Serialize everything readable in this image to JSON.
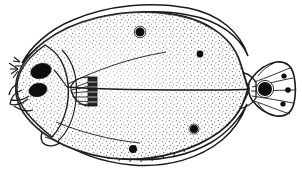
{
  "figure": {
    "subject_common_name": "flounder",
    "view": "left side, ocular surface",
    "style": "line drawing with stipple shading",
    "background_color": "#ffffff",
    "ink_color": "#1a1a1a",
    "stipple_color": "#5a5a5a",
    "canvas": {
      "width": 302,
      "height": 173
    }
  },
  "anatomy": {
    "body": {
      "name": "body-outline",
      "shape": "ovate-compressed flatfish disc",
      "outline_path": "M 16,92 C 14,74 26,56 44,42 C 74,19 120,9 163,13 C 205,17 232,37 240,62 C 244,74 246,82 248,88 C 246,97 242,108 234,118 C 218,138 186,153 150,158 C 110,163 68,152 42,132 C 24,118 17,105 16,92 Z",
      "fill": "#ffffff"
    },
    "head": {
      "name": "head-region",
      "outline_path": "M 17,90 C 16,74 27,58 45,45 C 58,52 66,66 68,84 C 70,104 64,124 52,137 C 32,121 18,106 17,90 Z",
      "gill_cover_path": "M 62,50 C 74,62 78,80 76,100 C 74,118 68,132 58,141"
    },
    "eyes": [
      {
        "name": "upper-eye",
        "cx": 41,
        "cy": 71,
        "rx": 10.5,
        "ry": 7.4,
        "rotation": -16,
        "color": "#0d0d0d"
      },
      {
        "name": "lower-eye",
        "cx": 38,
        "cy": 90,
        "rx": 9.2,
        "ry": 6.6,
        "rotation": -14,
        "color": "#0d0d0d"
      }
    ],
    "mouth": {
      "name": "mouth",
      "paths": [
        "M 22,90 C 16,92 11,97 10,104 C 14,106 22,104 28,99",
        "M 11,100 C 16,101 23,100 29,96",
        "M 14,106 C 20,110 27,112 33,110",
        "M 18,84 C 13,86 10,90 9,95"
      ]
    },
    "snout_spines": {
      "name": "snout-spines",
      "paths": [
        "M 18,69 L 9,63 M 18,69 L 10,69 M 18,69 L 11,74 M 18,71 L 13,78",
        "M 20,62 L 14,57 M 20,62 L 13,61 M 22,66 L 15,66"
      ]
    },
    "pectoral_fin": {
      "name": "pectoral-fin",
      "base_path": "M 71,86 C 74,80 80,77 88,77 L 95,79 L 96,104 L 88,106 C 79,105 73,98 71,90 Z",
      "rays": [
        "M 73,88 L 94,80",
        "M 72,90 L 94,85",
        "M 72,93 L 94,91",
        "M 73,97 L 94,97",
        "M 75,101 L 94,102",
        "M 78,104 L 93,105"
      ],
      "dark_tip": {
        "x": 88,
        "y": 77,
        "width": 9,
        "height": 29,
        "color": "#242424"
      }
    },
    "pelvic_fin": {
      "name": "pelvic-fin",
      "path": "M 48,126 C 42,130 39,137 43,143 C 48,148 58,146 63,140 C 67,135 66,129 62,126 Z",
      "rays": [
        "M 46,131 C 52,134 58,137 62,139",
        "M 45,137 C 51,139 57,141 62,142"
      ]
    },
    "dorsal_fin": {
      "name": "dorsal-fin",
      "membrane_path": "M 22,63 C 30,48 48,30 73,20 C 108,5 152,1 188,8 C 219,14 240,32 248,56 C 240,36 218,20 188,15 C 152,8 110,13 76,27 C 50,38 32,50 22,63 Z",
      "ray_count": 22,
      "ray_lines": [
        "M 24,62 L 21,68",
        "M 30,54 L 26,61",
        "M 37,47 L 33,55",
        "M 45,41 L 41,49",
        "M 54,35 L 50,44",
        "M 63,30 L 60,39",
        "M 73,25 L 70,35",
        "M 83,21 L 81,31",
        "M 94,18 L 92,28",
        "M 105,15 L 104,26",
        "M 116,13 L 115,24",
        "M 127,12 L 127,23",
        "M 138,12 L 139,23",
        "M 149,13 L 150,24",
        "M 160,15 L 162,26",
        "M 171,18 L 173,29",
        "M 181,22 L 184,33",
        "M 191,27 L 194,38",
        "M 201,33 L 205,44",
        "M 211,39 L 215,51",
        "M 220,46 L 225,58",
        "M 229,54 L 234,66"
      ]
    },
    "anal_fin": {
      "name": "anal-fin",
      "membrane_path": "M 62,140 C 74,152 100,162 132,165 C 168,168 200,158 222,140 C 234,130 242,118 247,104 C 240,118 228,132 212,142 C 190,155 160,162 130,159 C 100,156 76,148 62,140 Z",
      "ray_count": 18,
      "ray_lines": [
        "M 68,143 L 66,136",
        "M 77,149 L 76,141",
        "M 87,153 L 87,145",
        "M 97,156 L 98,148",
        "M 108,159 L 109,151",
        "M 119,161 L 120,153",
        "M 130,162 L 131,154",
        "M 141,162 L 142,154",
        "M 152,161 L 153,153",
        "M 163,159 L 164,151",
        "M 174,156 L 175,148",
        "M 184,152 L 186,144",
        "M 194,147 L 196,139",
        "M 204,141 L 207,133",
        "M 213,134 L 216,126",
        "M 221,126 L 225,118",
        "M 229,118 L 234,110",
        "M 236,109 L 241,101"
      ]
    },
    "caudal_peduncle": {
      "name": "caudal-peduncle",
      "path": "M 238,72 C 244,78 248,84 249,89 C 248,95 244,102 238,109 C 245,108 252,104 256,98 L 256,82 C 252,76 245,72 238,72 Z"
    },
    "caudal_fin": {
      "name": "caudal-fin",
      "outline_path": "M 252,78 C 258,70 266,64 276,62 C 286,61 292,66 294,76 C 296,86 296,94 294,103 C 292,112 286,117 276,116 C 266,114 258,108 252,100 C 249,95 248,90 249,89 C 248,84 249,82 252,78 Z",
      "ray_lines": [
        "M 254,82 C 266,78 280,72 290,68",
        "M 252,87 C 266,84 282,80 293,78",
        "M 251,91 C 266,91 283,90 295,90",
        "M 252,96 C 266,98 282,101 293,103",
        "M 254,101 C 266,105 280,111 290,114",
        "M 258,76 C 262,70 268,66 274,63",
        "M 258,103 C 262,110 268,114 274,116"
      ]
    },
    "lateral_line": {
      "name": "lateral-line",
      "path": "M 67,87 C 100,90 160,90 210,90 C 228,90 240,90 249,89",
      "head_branch": "M 67,87 C 62,80 58,74 54,70"
    },
    "body_creases": {
      "name": "body-creases",
      "paths": [
        "M 68,84 C 96,70 130,58 166,52",
        "M 56,122 C 80,132 110,140 140,143"
      ]
    }
  },
  "markings": {
    "description": "Dark pigment spots; ocelli are black centers with pale rings",
    "count": 9,
    "spots": [
      {
        "name": "dorsal-fin-ocellus-anterior",
        "cx": 140,
        "cy": 32,
        "r": 4.6,
        "type": "ocellus",
        "ring": true,
        "color": "#0d0d0d",
        "location": "dorsal fin"
      },
      {
        "name": "dorsal-fin-spot-posterior",
        "cx": 200,
        "cy": 54,
        "r": 3.4,
        "type": "solid",
        "ring": false,
        "color": "#0d0d0d",
        "location": "dorsal fin"
      },
      {
        "name": "anal-fin-spot-anterior",
        "cx": 133,
        "cy": 149,
        "r": 4.0,
        "type": "solid",
        "ring": false,
        "color": "#0d0d0d",
        "location": "anal fin"
      },
      {
        "name": "anal-fin-ocellus-posterior",
        "cx": 194,
        "cy": 129,
        "r": 4.0,
        "type": "ocellus",
        "ring": true,
        "color": "#0d0d0d",
        "location": "anal fin"
      },
      {
        "name": "caudal-fin-ocellus-central",
        "cx": 265,
        "cy": 89,
        "r": 7.0,
        "type": "ocellus",
        "ring": true,
        "color": "#0d0d0d",
        "location": "caudal fin"
      },
      {
        "name": "caudal-fin-spot-upper",
        "cx": 284,
        "cy": 76,
        "r": 2.6,
        "type": "solid",
        "ring": false,
        "color": "#0d0d0d",
        "location": "caudal fin"
      },
      {
        "name": "caudal-fin-spot-middle",
        "cx": 288,
        "cy": 90,
        "r": 2.8,
        "type": "solid",
        "ring": false,
        "color": "#0d0d0d",
        "location": "caudal fin"
      },
      {
        "name": "caudal-fin-spot-lower",
        "cx": 283,
        "cy": 104,
        "r": 2.6,
        "type": "solid",
        "ring": false,
        "color": "#0d0d0d",
        "location": "caudal fin"
      }
    ]
  }
}
